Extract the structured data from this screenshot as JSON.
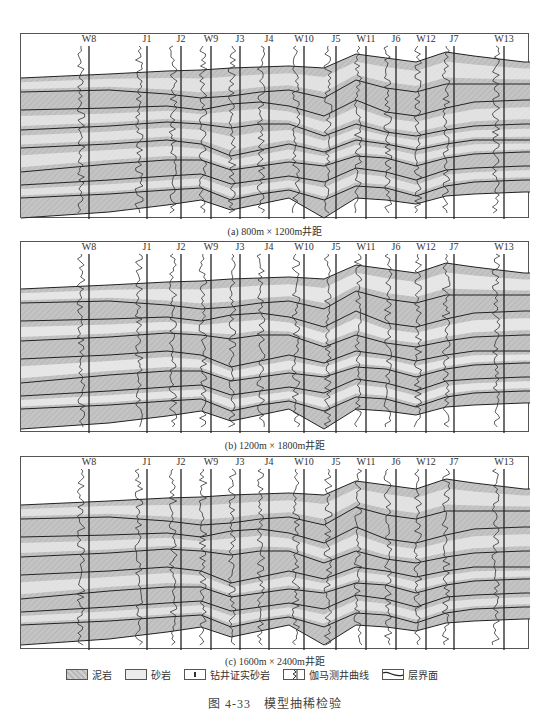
{
  "wells": [
    {
      "name": "W8",
      "x": 88
    },
    {
      "name": "J1",
      "x": 146
    },
    {
      "name": "J2",
      "x": 180
    },
    {
      "name": "W9",
      "x": 210
    },
    {
      "name": "J3",
      "x": 239
    },
    {
      "name": "J4",
      "x": 268
    },
    {
      "name": "W10",
      "x": 303
    },
    {
      "name": "J5",
      "x": 335
    },
    {
      "name": "W11",
      "x": 365
    },
    {
      "name": "J6",
      "x": 395
    },
    {
      "name": "W12",
      "x": 425
    },
    {
      "name": "J7",
      "x": 453
    },
    {
      "name": "W13",
      "x": 503
    }
  ],
  "panels": [
    {
      "id": "a",
      "caption": "(a) 800m × 1200m井距",
      "top": 33,
      "height": 185,
      "caption_top": 223
    },
    {
      "id": "b",
      "caption": "(b) 1200m × 1800m井距",
      "top": 241,
      "height": 191,
      "caption_top": 437
    },
    {
      "id": "c",
      "caption": "(c) 1600m × 2400m井距",
      "top": 456,
      "height": 193,
      "caption_top": 653
    }
  ],
  "legend": {
    "mudstone": "泥岩",
    "sandstone": "砂岩",
    "drilled_sand": "钻井证实砂岩",
    "gamma_curve": "伽马测井曲线",
    "boundary": "层界面"
  },
  "figure_title": "图 4-33　模型抽稀检验",
  "colors": {
    "mud": "#c4c4c4",
    "sand": "#ececec",
    "line": "#222",
    "frame": "#555"
  }
}
